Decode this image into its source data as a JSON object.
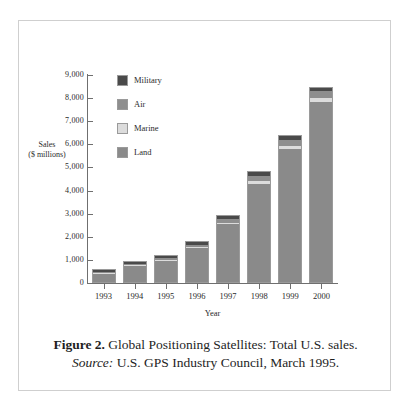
{
  "chart_data": {
    "type": "bar",
    "subtype": "stacked-bar",
    "title": "Global Positioning Satellites: Total U.S. sales.",
    "xlabel": "Year",
    "ylabel": "Sales\n($ millions)",
    "ylabel_line1": "Sales",
    "ylabel_line2": "($ millions)",
    "categories": [
      "1993",
      "1994",
      "1995",
      "1996",
      "1997",
      "1998",
      "1999",
      "2000"
    ],
    "ylim": [
      0,
      9000
    ],
    "ytick_values": [
      0,
      1000,
      2000,
      3000,
      4000,
      5000,
      6000,
      7000,
      8000,
      9000
    ],
    "ytick_labels": [
      "0",
      "1,000",
      "2,000",
      "3,000",
      "4,000",
      "5,000",
      "6,000",
      "7,000",
      "8,000",
      "9,000"
    ],
    "grid": false,
    "legend_position": "upper-left-inside",
    "series": [
      {
        "name": "Land",
        "color": "#8a8a8a",
        "values": [
          420,
          760,
          990,
          1530,
          2580,
          4330,
          5850,
          7880
        ]
      },
      {
        "name": "Marine",
        "color": "#dcdcdc",
        "values": [
          40,
          45,
          50,
          60,
          70,
          110,
          130,
          150
        ]
      },
      {
        "name": "Air",
        "color": "#8e8e8e",
        "values": [
          60,
          70,
          80,
          110,
          150,
          250,
          230,
          300
        ]
      },
      {
        "name": "Military",
        "color": "#4a4a4a",
        "values": [
          80,
          95,
          100,
          120,
          150,
          170,
          200,
          170
        ]
      }
    ],
    "totals": [
      600,
      970,
      1220,
      1820,
      2950,
      4860,
      6410,
      8500
    ],
    "legend_order": [
      "Military",
      "Air",
      "Marine",
      "Land"
    ]
  },
  "caption": {
    "figure_label": "Figure 2.",
    "figure_text": " Global Positioning Satellites:  Total U.S. sales.",
    "source_label": "Source:",
    "source_text": "  U.S. GPS Industry Council, March 1995."
  },
  "colors": {
    "military": "#4a4a4a",
    "air": "#8e8e8e",
    "marine": "#dcdcdc",
    "land": "#8a8a8a",
    "axis": "#6f6f6f",
    "border": "#cfcfcf",
    "background": "#ffffff"
  }
}
